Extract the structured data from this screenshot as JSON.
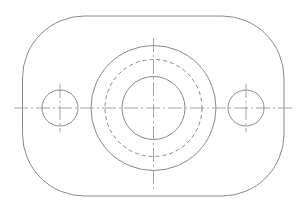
{
  "drawing": {
    "type": "mechanical-part-top-view",
    "colors": {
      "line": "#8a8a8a",
      "centerline": "#9a9a9a",
      "background": "#ffffff"
    },
    "plate": {
      "shape": "rounded-rectangle",
      "x": 22.5,
      "y": 16,
      "width": 261.5,
      "height": 180,
      "corner_radius": 62
    },
    "center_boss": {
      "cx": 153.5,
      "cy": 108,
      "outer_circle_r": 62.5,
      "hidden_circle_r": 48.5,
      "bore_circle_r": 31.5
    },
    "mounting_holes": [
      {
        "name": "left-hole",
        "cx": 60,
        "cy": 108,
        "r": 18
      },
      {
        "name": "right-hole",
        "cx": 246,
        "cy": 108,
        "r": 18
      }
    ],
    "centerlines": {
      "horizontal": {
        "x1": 14,
        "x2": 292,
        "y": 108
      },
      "main_vertical": {
        "x": 153.5,
        "y1": 38,
        "y2": 189
      },
      "hole_vertical_extent": {
        "y1": 84,
        "y2": 132
      }
    }
  }
}
